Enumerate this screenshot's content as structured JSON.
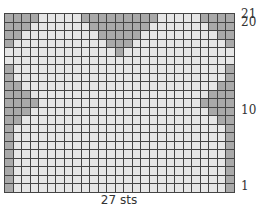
{
  "chart_title": "",
  "columns": 27,
  "rows": 21,
  "caption": "27 sts",
  "row_labels": [
    {
      "row": 21,
      "text": "21"
    },
    {
      "row": 20,
      "text": "20"
    },
    {
      "row": 10,
      "text": "10"
    },
    {
      "row": 1,
      "text": "1"
    }
  ],
  "colors": {
    "background_stitch": "#e6e6e6",
    "contrast_stitch": "#a9a9a9",
    "grid_line": "#444444"
  },
  "shaded": {
    "21": [
      [
        1,
        4
      ],
      [
        10,
        18
      ],
      [
        24,
        27
      ]
    ],
    "20": [
      [
        1,
        3
      ],
      [
        11,
        17
      ],
      [
        25,
        27
      ]
    ],
    "19": [
      [
        1,
        2
      ],
      [
        12,
        16
      ],
      [
        26,
        27
      ]
    ],
    "18": [
      [
        1,
        1
      ],
      [
        13,
        15
      ],
      [
        27,
        27
      ]
    ],
    "17": [
      [
        14,
        14
      ]
    ],
    "16": [],
    "15": [
      [
        1,
        1
      ],
      [
        27,
        27
      ]
    ],
    "14": [
      [
        1,
        1
      ],
      [
        27,
        27
      ]
    ],
    "13": [
      [
        1,
        2
      ],
      [
        26,
        27
      ]
    ],
    "12": [
      [
        1,
        3
      ],
      [
        25,
        27
      ]
    ],
    "11": [
      [
        1,
        4
      ],
      [
        24,
        27
      ]
    ],
    "10": [
      [
        1,
        3
      ],
      [
        25,
        27
      ]
    ],
    "9": [
      [
        1,
        2
      ],
      [
        26,
        27
      ]
    ],
    "8": [
      [
        1,
        1
      ],
      [
        27,
        27
      ]
    ],
    "7": [
      [
        1,
        1
      ],
      [
        27,
        27
      ]
    ],
    "6": [
      [
        1,
        1
      ],
      [
        27,
        27
      ]
    ],
    "5": [
      [
        1,
        1
      ],
      [
        27,
        27
      ]
    ],
    "4": [
      [
        1,
        1
      ],
      [
        27,
        27
      ]
    ],
    "3": [
      [
        1,
        1
      ],
      [
        27,
        27
      ]
    ],
    "2": [
      [
        1,
        1
      ],
      [
        27,
        27
      ]
    ],
    "1": [
      [
        1,
        1
      ],
      [
        27,
        27
      ]
    ]
  }
}
